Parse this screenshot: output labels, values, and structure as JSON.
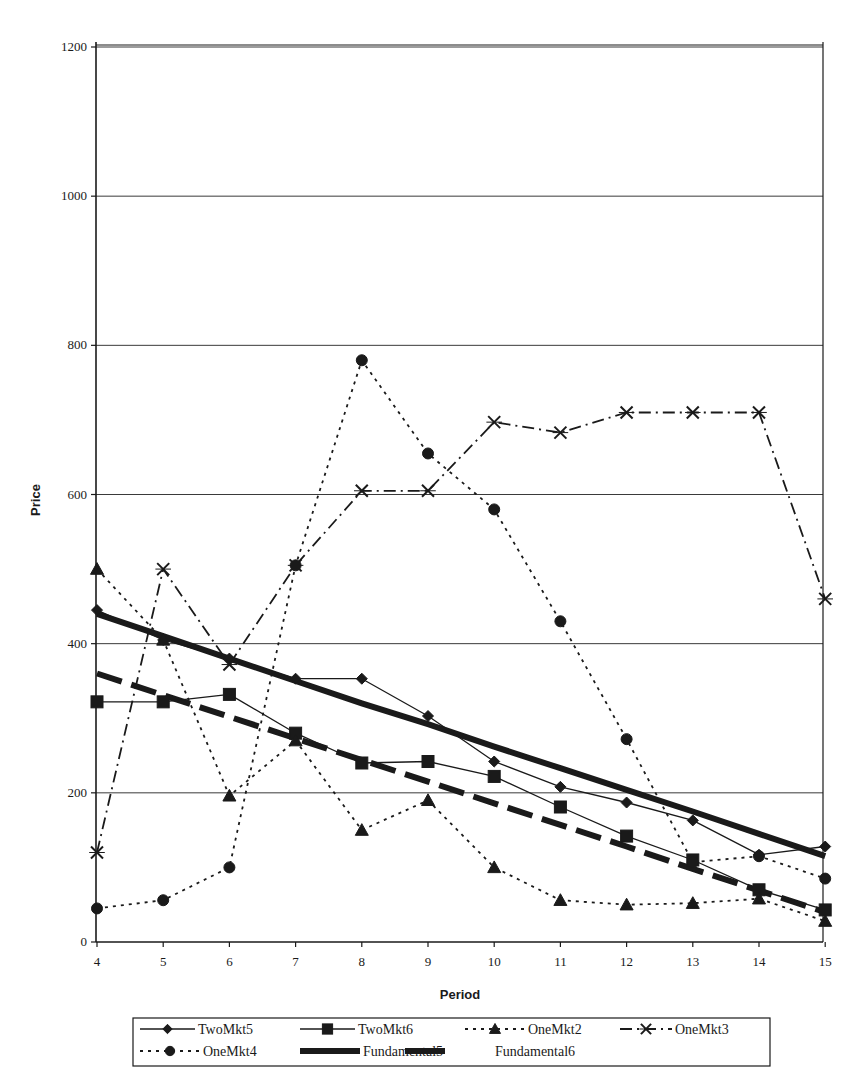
{
  "chart_data": {
    "type": "line",
    "title": "",
    "xlabel": "Period",
    "ylabel": "Price",
    "x": [
      4,
      5,
      6,
      7,
      8,
      9,
      10,
      11,
      12,
      13,
      14,
      15
    ],
    "xlim": [
      4,
      15
    ],
    "ylim": [
      0,
      1200
    ],
    "yticks": [
      0,
      200,
      400,
      600,
      800,
      1000,
      1200
    ],
    "xticks": [
      4,
      5,
      6,
      7,
      8,
      9,
      10,
      11,
      12,
      13,
      14,
      15
    ],
    "grid": "horizontal",
    "legend_position": "bottom",
    "series": [
      {
        "name": "TwoMkt5",
        "marker": "diamond",
        "line": "solid",
        "width": 1.3,
        "values": [
          445,
          405,
          380,
          353,
          353,
          303,
          242,
          208,
          187,
          163,
          117,
          128
        ]
      },
      {
        "name": "TwoMkt6",
        "marker": "square",
        "line": "solid",
        "width": 1.3,
        "values": [
          322,
          322,
          332,
          280,
          240,
          242,
          222,
          181,
          142,
          110,
          70,
          43
        ]
      },
      {
        "name": "OneMkt2",
        "marker": "triangle",
        "line": "dotted",
        "width": 1.8,
        "values": [
          500,
          405,
          196,
          270,
          150,
          190,
          100,
          56,
          50,
          52,
          58,
          28
        ]
      },
      {
        "name": "OneMkt3",
        "marker": "x",
        "line": "dashdot",
        "width": 1.8,
        "values": [
          120,
          500,
          372,
          505,
          605,
          605,
          697,
          683,
          710,
          710,
          710,
          460
        ]
      },
      {
        "name": "OneMkt4",
        "marker": "circle",
        "line": "dotted",
        "width": 1.8,
        "values": [
          45,
          56,
          100,
          505,
          780,
          655,
          580,
          430,
          272,
          107,
          115,
          85
        ]
      },
      {
        "name": "Fundamental5",
        "marker": "none",
        "line": "thick-solid",
        "width": 6,
        "values": [
          440,
          410,
          380,
          350,
          320,
          292,
          262,
          233,
          204,
          175,
          145,
          115
        ]
      },
      {
        "name": "Fundamental6",
        "marker": "none",
        "line": "thick-dashed",
        "width": 6,
        "values": [
          360,
          331,
          302,
          273,
          244,
          215,
          186,
          157,
          128,
          98,
          69,
          40
        ]
      }
    ]
  },
  "colors": {
    "ink": "#1a1a1a",
    "grid": "#3a3a3a",
    "background": "#ffffff"
  }
}
